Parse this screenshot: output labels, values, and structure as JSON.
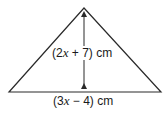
{
  "figure": {
    "shape": "triangle",
    "height_label": {
      "open": "(2",
      "variable": "x",
      "rest": " + 7) cm"
    },
    "base_label": {
      "open": "(3",
      "variable": "x",
      "rest": " − 4) cm"
    },
    "colors": {
      "stroke": "#2a2a2a",
      "fill": "#ffffff"
    }
  }
}
